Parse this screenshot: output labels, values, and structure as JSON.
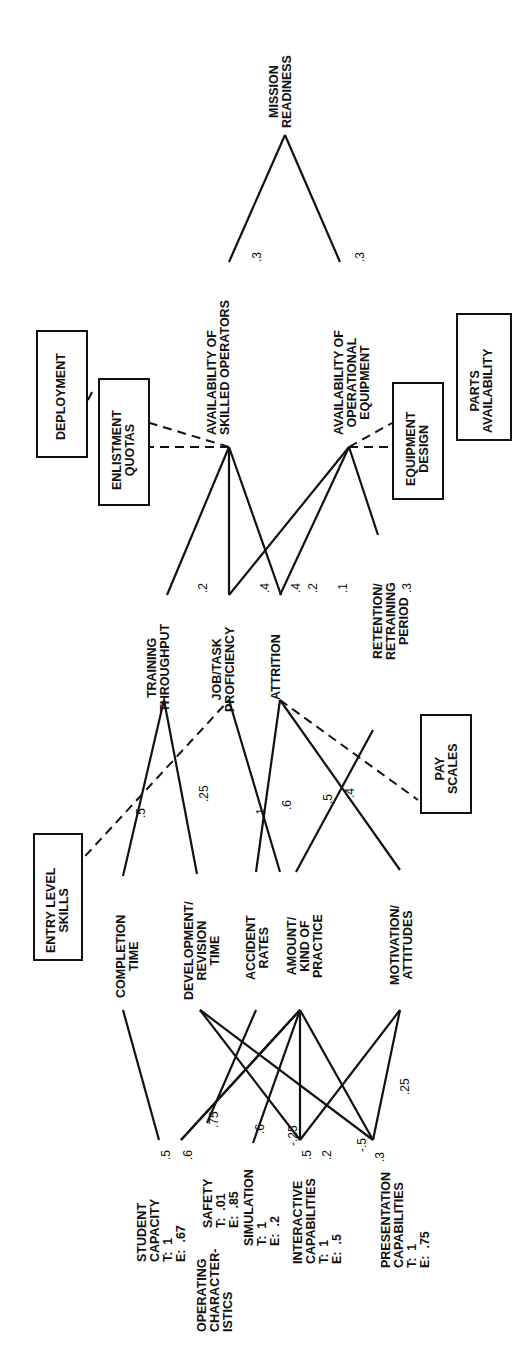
{
  "diagram": {
    "nodes": {
      "mission": "MISSION\nREADINESS",
      "skilled": "AVAILABILITY OF\nSKILLED OPERATORS",
      "equipment": "AVAILABILITY OF\nOPERATIONAL\nEQUIPMENT",
      "throughput": "TRAINING\nTHROUGHPUT",
      "proficiency": "JOB/TASK\nPROFICIENCY",
      "attrition": "ATTRITION",
      "retention": "RETENTION/\nRETRAINING\nPERIOD",
      "completion": "COMPLETION\nTIME",
      "development": "DEVELOPMENT/\nREVISION\nTIME",
      "accident": "ACCIDENT\nRATES",
      "practice": "AMOUNT/\nKIND OF\nPRACTICE",
      "motivation": "MOTIVATION/\nATTITUDES",
      "student": "STUDENT\nCAPACITY\nT:  1\nE:  .67",
      "operating": "OPERATING\nCHARACTER-\nISTICS",
      "safety": "SAFETY\nT:  .01\nE:  .85",
      "simulation": "SIMULATION\nT:  1\nE:  .2",
      "interactive": "INTERACTIVE\nCAPABILITIES\nT:  1\nE:  .5",
      "presentation": "PRESENTATION\nCAPABILITIES\nT:  1\nE:  .75"
    },
    "boxes": {
      "deployment": "DEPLOYMENT",
      "enlistment": "ENLISTMENT\nQUOTAS",
      "equipment_design": "EQUIPMENT\nDESIGN",
      "parts": "PARTS\nAVAILABILITY",
      "entry": "ENTRY LEVEL\nSKILLS",
      "pay": "PAY\nSCALES"
    },
    "weights": [
      {
        "t": ".3",
        "x": 250,
        "y": 262
      },
      {
        "t": ".3",
        "x": 353,
        "y": 262
      },
      {
        "t": ".2",
        "x": 196,
        "y": 593
      },
      {
        "t": ".4",
        "x": 258,
        "y": 593
      },
      {
        "t": ".4",
        "x": 289,
        "y": 593
      },
      {
        "t": ".2",
        "x": 306,
        "y": 593
      },
      {
        "t": ".1",
        "x": 336,
        "y": 593
      },
      {
        "t": ".3",
        "x": 400,
        "y": 593
      },
      {
        "t": ".5",
        "x": 134,
        "y": 818
      },
      {
        "t": ".25",
        "x": 197,
        "y": 802
      },
      {
        "t": ".1",
        "x": 254,
        "y": 818
      },
      {
        "t": ".6",
        "x": 280,
        "y": 810
      },
      {
        "t": ".5",
        "x": 321,
        "y": 804
      },
      {
        "t": ".4",
        "x": 343,
        "y": 798
      },
      {
        "t": ".5",
        "x": 159,
        "y": 1160
      },
      {
        "t": ".6",
        "x": 181,
        "y": 1160
      },
      {
        "t": ".75",
        "x": 207,
        "y": 1128
      },
      {
        "t": ".6",
        "x": 253,
        "y": 1134
      },
      {
        "t": "-.25",
        "x": 286,
        "y": 1146
      },
      {
        "t": ".5",
        "x": 300,
        "y": 1160
      },
      {
        "t": ".2",
        "x": 320,
        "y": 1160
      },
      {
        "t": "-.5",
        "x": 355,
        "y": 1152
      },
      {
        "t": ".3",
        "x": 373,
        "y": 1162
      },
      {
        "t": ".25",
        "x": 398,
        "y": 1095
      }
    ],
    "solid_links": [
      [
        285,
        135,
        229,
        262
      ],
      [
        285,
        135,
        340,
        262
      ],
      [
        229,
        447,
        167,
        595
      ],
      [
        229,
        447,
        229,
        595
      ],
      [
        229,
        447,
        281,
        595
      ],
      [
        349,
        447,
        229,
        595
      ],
      [
        349,
        447,
        280,
        595
      ],
      [
        349,
        447,
        378,
        535
      ],
      [
        164,
        700,
        123,
        876
      ],
      [
        164,
        700,
        197,
        874
      ],
      [
        229,
        700,
        280,
        872
      ],
      [
        280,
        700,
        256,
        872
      ],
      [
        280,
        700,
        400,
        870
      ],
      [
        373,
        730,
        296,
        872
      ],
      [
        123,
        1010,
        159,
        1140
      ],
      [
        181,
        1140,
        300,
        1010
      ],
      [
        207,
        1123,
        256,
        1010
      ],
      [
        200,
        1010,
        373,
        1140
      ],
      [
        200,
        1010,
        300,
        1140
      ],
      [
        253,
        1143,
        300,
        1010
      ],
      [
        300,
        1010,
        300,
        1140
      ],
      [
        300,
        1010,
        373,
        1140
      ],
      [
        300,
        1010,
        181,
        1140
      ],
      [
        400,
        1010,
        300,
        1140
      ],
      [
        400,
        1010,
        373,
        1140
      ]
    ],
    "dashed_links": [
      [
        229,
        447,
        150,
        447
      ],
      [
        229,
        447,
        150,
        423
      ],
      [
        349,
        447,
        392,
        447
      ],
      [
        349,
        447,
        392,
        423
      ],
      [
        88,
        400,
        93,
        390
      ],
      [
        65,
        878,
        229,
        700
      ],
      [
        280,
        700,
        418,
        800
      ]
    ]
  }
}
